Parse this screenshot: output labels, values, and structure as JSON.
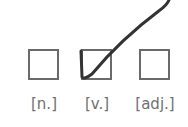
{
  "options": [
    {
      "label": "[n.]",
      "checked": false
    },
    {
      "label": "[v.]",
      "checked": true
    },
    {
      "label": "[adj.]",
      "checked": false
    }
  ],
  "colors": {
    "box_border": "#6a6a6a",
    "label": "#707070",
    "check": "#333333"
  }
}
